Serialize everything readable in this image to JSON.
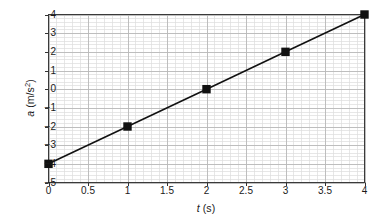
{
  "figure": {
    "background_color": "#ffffff",
    "axis_color": "#333333",
    "major_grid_color": "#b9b9b9",
    "minor_grid_color": "#dcdcdc",
    "series_color": "#111111"
  },
  "axis_titles": {
    "x_variable": "t",
    "x_units": "(s)",
    "y_variable": "a",
    "y_units_prefix": "(m/s",
    "y_units_exponent": "2",
    "y_units_suffix": ")"
  },
  "ticks": {
    "x_labels": [
      "0",
      "0.5",
      "1",
      "1.5",
      "2",
      "2.5",
      "3",
      "3.5",
      "4"
    ],
    "x_values": [
      0,
      0.5,
      1,
      1.5,
      2,
      2.5,
      3,
      3.5,
      4
    ],
    "y_labels": [
      "4",
      "3",
      "2",
      "1",
      "0",
      "−1",
      "−2",
      "−3",
      "−4",
      "−5"
    ],
    "y_values": [
      4,
      3,
      2,
      1,
      0,
      -1,
      -2,
      -3,
      -4,
      -5
    ]
  },
  "chart_data": {
    "type": "line",
    "title": "",
    "xlabel": "t (s)",
    "ylabel": "a (m/s²)",
    "xlim": [
      0,
      4
    ],
    "ylim": [
      -5,
      4
    ],
    "grid": true,
    "legend": "none",
    "marker": "square",
    "x": [
      0,
      1,
      2,
      3,
      4
    ],
    "series": [
      {
        "name": "acceleration",
        "values": [
          -4,
          -2,
          0,
          2,
          4
        ],
        "points": [
          {
            "x": 0,
            "y": -4
          },
          {
            "x": 1,
            "y": -2
          },
          {
            "x": 2,
            "y": 0
          },
          {
            "x": 3,
            "y": 2
          },
          {
            "x": 4,
            "y": 4
          }
        ]
      }
    ],
    "x_major_step": 0.5,
    "y_major_step": 1,
    "x_minor_step": 0.1,
    "y_minor_step": 0.2
  }
}
